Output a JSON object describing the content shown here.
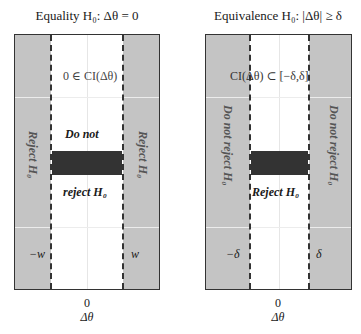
{
  "panels": [
    {
      "title": "Equality H₀: Δθ = 0",
      "annotation": "0 ∈ CI(Δθ)",
      "left_region_label": "Reject H₀",
      "right_region_label": "Reject H₀",
      "center_label_top": "Do not",
      "center_label_bottom": "reject H₀",
      "left_bound": "−w",
      "right_bound": "w",
      "x_tick": "0",
      "x_label": "Δθ"
    },
    {
      "title": "Equivalence H₀: |Δθ| ≥ δ",
      "annotation": "CI(Δθ) ⊂ [−δ,δ]",
      "left_region_label": "Do not reject H₀",
      "right_region_label": "Do not reject H₀",
      "center_label": "Reject H₀",
      "left_bound": "−δ",
      "right_bound": "δ",
      "x_tick": "0",
      "x_label": "Δθ"
    }
  ],
  "colors": {
    "shaded_region": "#c4c4c4",
    "confidence_bar": "#333333",
    "border": "#333333"
  }
}
